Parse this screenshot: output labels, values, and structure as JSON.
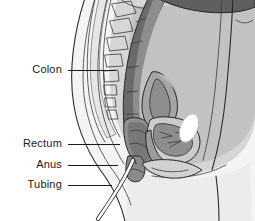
{
  "figure": {
    "background_color": "#ffffff",
    "width": 255,
    "height": 221
  },
  "labels": [
    {
      "id": "colon",
      "text": "Colon",
      "text_x": 62,
      "text_y": 70,
      "line_x1": 68,
      "line_x2": 116,
      "line_y": 70
    },
    {
      "id": "rectum",
      "text": "Rectum",
      "text_x": 62,
      "text_y": 144,
      "line_x1": 68,
      "line_x2": 120,
      "line_y": 144
    },
    {
      "id": "anus",
      "text": "Anus",
      "text_x": 62,
      "text_y": 165,
      "line_x1": 68,
      "line_x2": 118,
      "line_y": 165
    },
    {
      "id": "tubing",
      "text": "Tubing",
      "text_x": 62,
      "text_y": 185,
      "line_x1": 68,
      "line_x2": 112,
      "line_y": 185
    }
  ],
  "structures": [
    {
      "id": "body-outline",
      "name": "body-contour",
      "fill": "#f4f4f4"
    },
    {
      "id": "abdominal-cavity",
      "name": "abdominal-cavity",
      "fill": "#d6d6d6"
    },
    {
      "id": "colon-lumen",
      "name": "colon-lumen",
      "fill": "#8a8a8a"
    },
    {
      "id": "colon-wall",
      "name": "colon-wall",
      "fill": "#6e6e6e"
    },
    {
      "id": "rectum-body",
      "name": "rectum",
      "fill": "#9a9a9a"
    },
    {
      "id": "anal-canal",
      "name": "anal-canal",
      "fill": "#8f8f8f"
    },
    {
      "id": "uterus",
      "name": "uterus",
      "fill": "#a8a8a8"
    },
    {
      "id": "bladder",
      "name": "bladder",
      "fill": "#cfcfcf"
    },
    {
      "id": "vagina",
      "name": "vaginal-canal",
      "fill": "#7d7d7d"
    },
    {
      "id": "pubic-bone",
      "name": "pubic-symphysis",
      "fill": "#ffffff"
    },
    {
      "id": "sacrum-vertebrae",
      "name": "sacrum-vertebrae",
      "fill": "#f2f2f2"
    },
    {
      "id": "spinal-canal",
      "name": "spinal-canal",
      "fill": "#e2e2e2"
    },
    {
      "id": "tubing-line",
      "name": "rectal-tubing",
      "fill": "#ffffff"
    },
    {
      "id": "thigh",
      "name": "thigh-buttock",
      "fill": "#ececec"
    }
  ],
  "palette": {
    "stroke_dark": "#2b2b2b",
    "stroke_mid": "#3a3a3a",
    "text": "#1a1a1a",
    "background": "#ffffff",
    "tissue_light": "#f4f4f4",
    "tissue_mid": "#d6d6d6",
    "tissue_dark": "#6e6e6e",
    "bone_white": "#ffffff"
  }
}
